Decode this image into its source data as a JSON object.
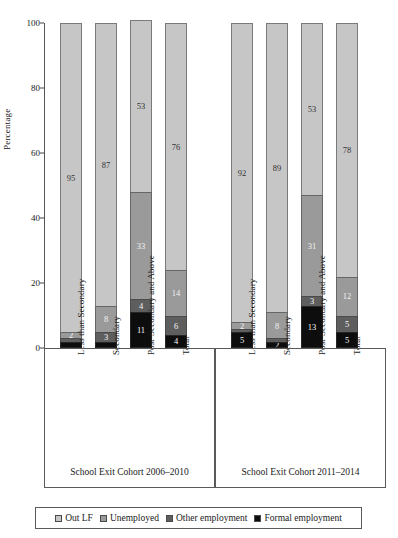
{
  "chart_data": {
    "type": "bar",
    "subtype": "stacked-percentage",
    "title": "",
    "xlabel": "",
    "ylabel": "Percentage",
    "ylim": [
      0,
      100
    ],
    "yticks": [
      0,
      20,
      40,
      60,
      80,
      100
    ],
    "grid": false,
    "legend_position": "bottom",
    "legend": [
      "Out LF",
      "Unemployed",
      "Other employment",
      "Formal employment"
    ],
    "colors": {
      "Out LF": "#c6c6c6",
      "Unemployed": "#9a9a9a",
      "Other employment": "#5e5e5e",
      "Formal employment": "#0d0d0d"
    },
    "groups": [
      {
        "caption": "School Exit Cohort 2006–2010",
        "categories": [
          "Less than Secondary",
          "Secondary",
          "Post-Secondary and Above",
          "Total"
        ],
        "series": [
          {
            "name": "Out LF",
            "values": [
              95,
              87,
              53,
              76
            ]
          },
          {
            "name": "Unemployed",
            "values": [
              2,
              8,
              33,
              14
            ]
          },
          {
            "name": "Other employment",
            "values": [
              1,
              3,
              4,
              6
            ]
          },
          {
            "name": "Formal employment",
            "values": [
              2,
              2,
              11,
              4
            ]
          }
        ]
      },
      {
        "caption": "School Exit Cohort 2011–2014",
        "categories": [
          "Less than Secondary",
          "Secondary",
          "Post-Secondary and Above",
          "Total"
        ],
        "series": [
          {
            "name": "Out LF",
            "values": [
              92,
              89,
              53,
              78
            ]
          },
          {
            "name": "Unemployed",
            "values": [
              2,
              8,
              31,
              12
            ]
          },
          {
            "name": "Other employment",
            "values": [
              1,
              1,
              3,
              5
            ]
          },
          {
            "name": "Formal employment",
            "values": [
              5,
              2,
              13,
              5
            ]
          }
        ]
      }
    ],
    "bar_labels": {
      "group1": [
        [
          "95",
          "2",
          "",
          ""
        ],
        [
          "87",
          "8",
          "3",
          ""
        ],
        [
          "53",
          "33",
          "4",
          "11"
        ],
        [
          "76",
          "14",
          "6",
          "4"
        ]
      ],
      "group2": [
        [
          "92",
          "2",
          "",
          "5"
        ],
        [
          "89",
          "8",
          "",
          "2"
        ],
        [
          "53",
          "31",
          "3",
          "13"
        ],
        [
          "78",
          "12",
          "5",
          "5"
        ]
      ]
    }
  },
  "axis": {
    "ylabel": "Percentage",
    "ticks": [
      "100",
      "80",
      "60",
      "40",
      "20",
      "0"
    ]
  },
  "groups": [
    {
      "caption": "School Exit Cohort 2006–2010",
      "cats": [
        "Less than Secondary",
        "Secondary",
        "Post-Secondary and Above",
        "Total"
      ]
    },
    {
      "caption": "School Exit Cohort 2011–2014",
      "cats": [
        "Less than Secondary",
        "Secondary",
        "Post-Secondary and Above",
        "Total"
      ]
    }
  ],
  "legend": {
    "items": [
      {
        "label": "Out LF",
        "color": "#c6c6c6"
      },
      {
        "label": "Unemployed",
        "color": "#9a9a9a"
      },
      {
        "label": "Other employment",
        "color": "#5e5e5e"
      },
      {
        "label": "Formal employment",
        "color": "#0d0d0d"
      }
    ]
  }
}
